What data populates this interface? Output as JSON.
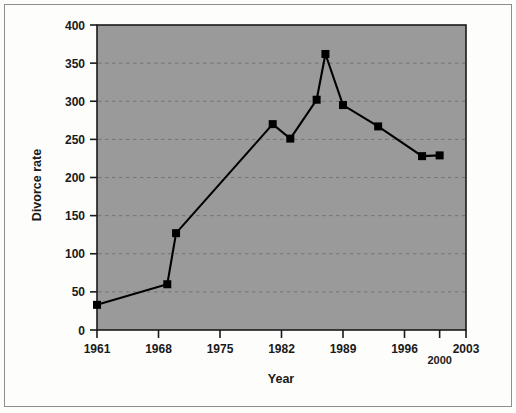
{
  "chart_data": {
    "type": "line",
    "title": "",
    "subtitle": "",
    "xlabel": "Year",
    "ylabel": "Divorce rate",
    "x": [
      1961,
      1969,
      1970,
      1981,
      1983,
      1986,
      1987,
      1989,
      1993,
      1998,
      2000
    ],
    "values": [
      33,
      60,
      127,
      270,
      251,
      302,
      362,
      295,
      267,
      228,
      229
    ],
    "series": [
      {
        "name": "Divorce rate",
        "x": [
          1961,
          1969,
          1970,
          1981,
          1983,
          1986,
          1987,
          1989,
          1993,
          1998,
          2000
        ],
        "values": [
          33,
          60,
          127,
          270,
          251,
          302,
          362,
          295,
          267,
          228,
          229
        ]
      }
    ],
    "xlim": [
      1961,
      2003
    ],
    "ylim": [
      0,
      400
    ],
    "xticks": [
      1961,
      1968,
      1975,
      1982,
      1989,
      1996,
      2000,
      2003
    ],
    "xtick_labels": [
      "1961",
      "1968",
      "1975",
      "1982",
      "1989",
      "1996",
      "2000",
      "2003"
    ],
    "yticks": [
      0,
      50,
      100,
      150,
      200,
      250,
      300,
      350,
      400
    ],
    "ytick_labels": [
      "0",
      "50",
      "100",
      "150",
      "200",
      "250",
      "300",
      "350",
      "400"
    ],
    "grid": true,
    "grid_axis": "y",
    "grid_style": "dashed",
    "legend": false,
    "legend_position": "none",
    "marker": "square",
    "line_color": "#000000",
    "marker_color": "#000000",
    "plot_background": "#9a9a9a",
    "figure_background": "#fdfdfc",
    "grid_color": "#6f6f6f",
    "axis_color": "#1a1a1a"
  },
  "axes": {
    "x_title": "Year",
    "y_title": "Divorce rate"
  }
}
